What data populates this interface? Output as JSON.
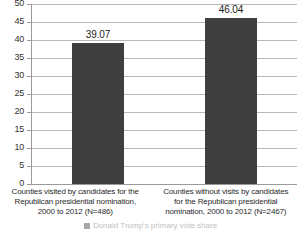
{
  "chart_data": {
    "type": "bar",
    "title": "",
    "subtitle": "",
    "xlabel": "",
    "ylabel": "",
    "ylim": [
      0,
      50
    ],
    "ytick_step": 5,
    "yticks": [
      "50",
      "45",
      "40",
      "35",
      "30",
      "25",
      "20",
      "15",
      "10",
      "5",
      "0"
    ],
    "grid": true,
    "legend_position": "bottom",
    "categories": [
      "Counties visited by candidates for the Republican presidential nomination, 2000 to 2012 (N=486)",
      "Counties without visits by candidates for the Republican presidential nomination, 2000 to 2012 (N=2467)"
    ],
    "category_lines": [
      [
        "Counties visited by candidates for the",
        "Republican presidential nomination,",
        "2000 to 2012 (N=486)"
      ],
      [
        "Counties without visits by candidates",
        "for the Republican presidential",
        "nomination, 2000 to 2012 (N=2467)"
      ]
    ],
    "values": [
      39.07,
      46.04
    ],
    "data_labels": [
      "39.07",
      "46.04"
    ],
    "series": [
      {
        "name": "Donald Trump's primary vote share",
        "values": [
          39.07,
          46.04
        ],
        "color": "#3f3f3f"
      }
    ],
    "legend": [
      {
        "label": "Donald Trump's primary vote share",
        "color": "#3f3f3f"
      }
    ]
  },
  "colors": {
    "bar": "#3f3f3f",
    "gridline": "#b9b9b9",
    "axis": "#9a9a9a",
    "background": "#ffffff",
    "text": "#262626"
  }
}
